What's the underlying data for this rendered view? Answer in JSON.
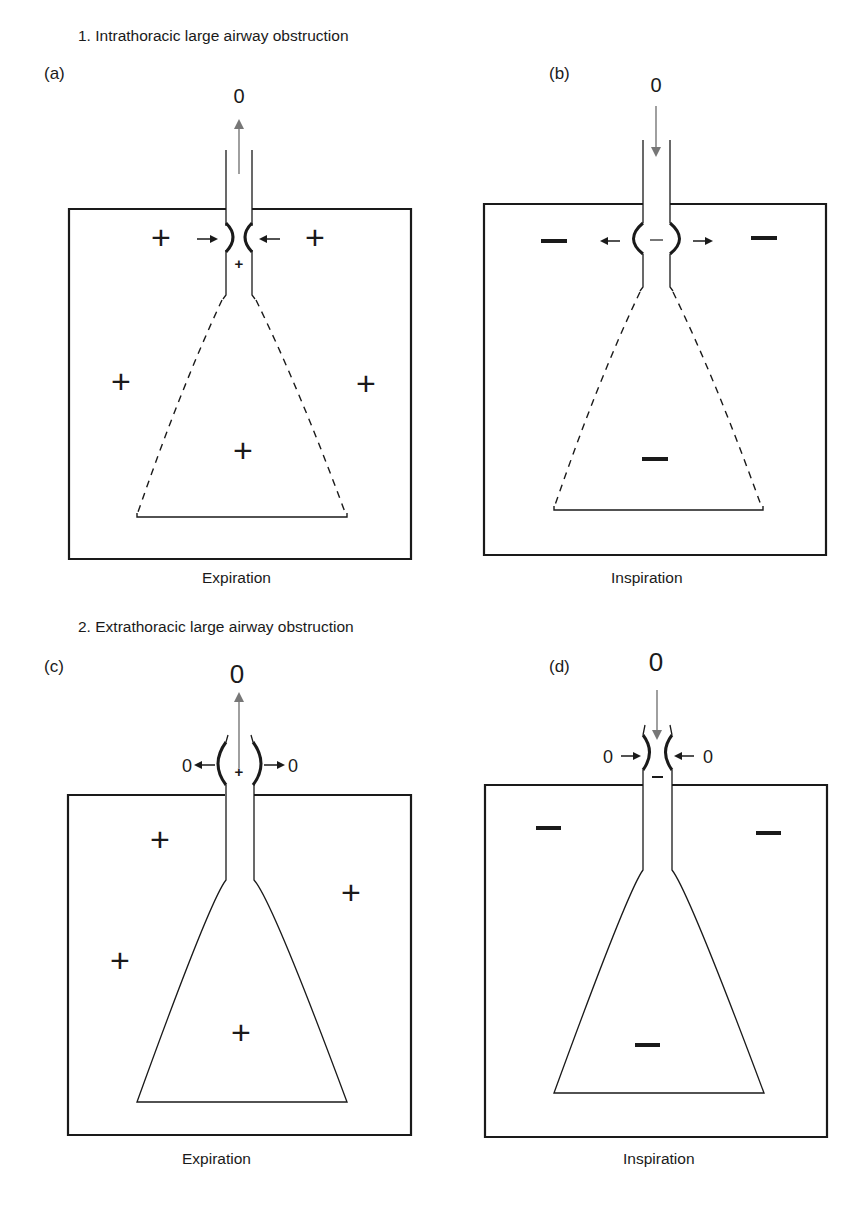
{
  "sections": [
    {
      "title": "1. Intrathoracic large airway obstruction"
    },
    {
      "title": "2. Extrathoracic large airway obstruction"
    }
  ],
  "panels": {
    "a": {
      "label": "(a)",
      "caption": "Expiration",
      "flow_label": "0",
      "flow_direction": "up",
      "pleural_signs": [
        "+",
        "+",
        "+",
        "+",
        "+"
      ],
      "intraluminal_sign": "+",
      "wall_motion": "inward",
      "lower_airway_style": "dashed"
    },
    "b": {
      "label": "(b)",
      "caption": "Inspiration",
      "flow_label": "0",
      "flow_direction": "down",
      "pleural_signs": [
        "–",
        "–",
        "–"
      ],
      "intraluminal_sign": "–",
      "wall_motion": "outward",
      "lower_airway_style": "dashed"
    },
    "c": {
      "label": "(c)",
      "caption": "Expiration",
      "flow_label": "0",
      "flow_direction": "up",
      "pleural_signs": [
        "+",
        "+",
        "+",
        "+"
      ],
      "intraluminal_sign": "+",
      "side_labels": [
        "0",
        "0"
      ],
      "wall_motion": "outward",
      "lower_airway_style": "solid"
    },
    "d": {
      "label": "(d)",
      "caption": "Inspiration",
      "flow_label": "0",
      "flow_direction": "down",
      "pleural_signs": [
        "–",
        "–",
        "–"
      ],
      "intraluminal_sign": "–",
      "side_labels": [
        "0",
        "0"
      ],
      "wall_motion": "inward",
      "lower_airway_style": "solid"
    }
  },
  "colors": {
    "line": "#1a1a1a",
    "flow_arrow": "#777777",
    "background": "#ffffff"
  }
}
